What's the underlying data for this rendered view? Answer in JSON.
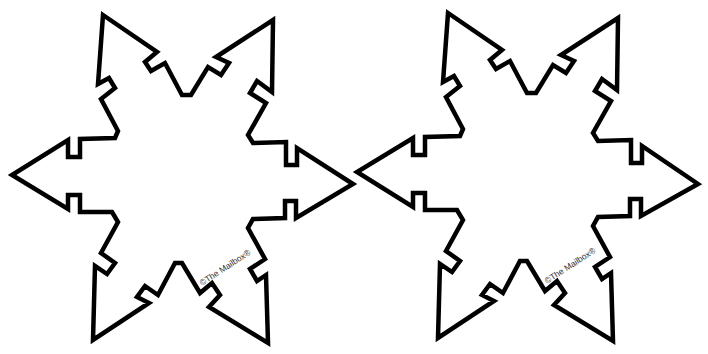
{
  "page": {
    "background": "#ffffff",
    "outline_color": "#000000"
  },
  "stars": [
    {
      "id": "left",
      "credit": "©The Mailbox®"
    },
    {
      "id": "right",
      "credit": "©The Mailbox®"
    }
  ]
}
